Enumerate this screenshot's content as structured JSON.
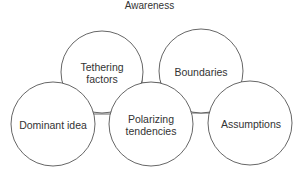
{
  "diagram": {
    "title": "Awareness",
    "stroke_color": "#555555",
    "nodes": [
      {
        "id": "dominant-idea",
        "label": "Dominant idea",
        "cx": 53,
        "cy": 124,
        "r": 42
      },
      {
        "id": "tethering-factors",
        "label_line1": "Tethering",
        "label_line2": "factors",
        "cx": 102,
        "cy": 72,
        "r": 41
      },
      {
        "id": "polarizing-tendencies",
        "label_line1": "Polarizing",
        "label_line2": "tendencies",
        "cx": 151,
        "cy": 124,
        "r": 42
      },
      {
        "id": "boundaries",
        "label": "Boundaries",
        "cx": 201,
        "cy": 71,
        "r": 42
      },
      {
        "id": "assumptions",
        "label": "Assumptions",
        "cx": 250,
        "cy": 123,
        "r": 42
      }
    ]
  }
}
